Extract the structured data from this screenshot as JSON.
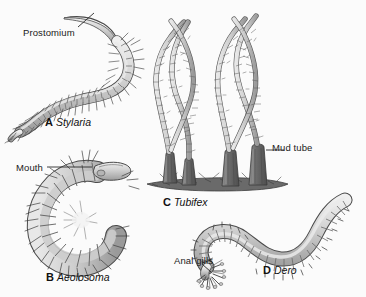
{
  "figure": {
    "kind": "scientific-illustration",
    "background_color": "#fbfbfb",
    "ink_color": "#3a3a3a",
    "fill_light": "#d8d8d8",
    "fill_mid": "#bdbdbd",
    "fill_dark": "#8a8a8a",
    "tube_color": "#6f6f6f"
  },
  "annotations": {
    "prostomium": "Prostomium",
    "mouth": "Mouth",
    "mud_tube": "Mud tube",
    "anal_gills": "Anal gills"
  },
  "panels": [
    {
      "letter": "A",
      "name": "Stylaria"
    },
    {
      "letter": "B",
      "name": "Aeolosoma"
    },
    {
      "letter": "C",
      "name": "Tubifex"
    },
    {
      "letter": "D",
      "name": "Dero"
    }
  ]
}
